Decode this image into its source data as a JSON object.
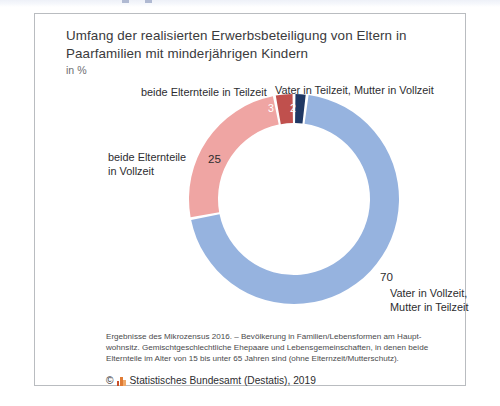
{
  "frame": {
    "border_color": "#b9bcc0",
    "background": "#ffffff"
  },
  "chart_data": {
    "type": "pie",
    "variant": "donut",
    "title": "Umfang der realisierten Erwerbsbeteiligung von Eltern in Paarfamilien mit minderjährigen Kindern",
    "subtitle": "in %",
    "unit": "%",
    "start_angle_deg": 0,
    "direction": "clockwise",
    "categories": [
      "Vater in Teilzeit, Mutter in Vollzeit",
      "Vater in Vollzeit, Mutter in Teilzeit",
      "beide Elternteile in Vollzeit",
      "beide Elternteile in Teilzeit"
    ],
    "values": [
      2,
      70,
      25,
      3
    ],
    "colors": [
      "#1f3864",
      "#96b3df",
      "#efa5a3",
      "#c0504d"
    ],
    "label_colors": [
      "#ffffff",
      "#2d2d2f",
      "#2d2d2f",
      "#ffffff"
    ],
    "legend": "none",
    "grid": false,
    "slices": [
      {
        "label": "Vater in Teilzeit, Mutter in Vollzeit",
        "value": 2,
        "value_text": "2",
        "color": "#1f3864"
      },
      {
        "label": "Vater in Vollzeit, Mutter in Teilzeit",
        "value": 70,
        "value_text": "70",
        "color": "#96b3df"
      },
      {
        "label": "beide Elternteile in Vollzeit",
        "value": 25,
        "value_text": "25",
        "color": "#efa5a3"
      },
      {
        "label": "beide Elternteile in Teilzeit",
        "value": 3,
        "value_text": "3",
        "color": "#c0504d"
      }
    ]
  },
  "callouts": {
    "teilzeit_both": "beide Elternteile in Teilzeit",
    "vater_teilzeit": "Vater in Teilzeit, Mutter in Vollzeit",
    "vollzeit_both_line1": "beide Elternteile",
    "vollzeit_both_line2": "in Vollzeit",
    "vater_vollzeit_line1": "Vater in Vollzeit,",
    "vater_vollzeit_line2": "Mutter in Teilzeit"
  },
  "footnote": {
    "line1": "Ergebnisse des Mikrozensus 2016. – Bevölkerung in Familien/Lebensformen am Haupt-",
    "line2": "wohnsitz. Gemischtgeschlechtliche Ehepaare und Lebensgemeinschaften, in denen beide",
    "line3": "Elternteile im Alter von 15 bis unter 65 Jahren sind (ohne Elternzeit/Mutterschutz)."
  },
  "copyright": {
    "symbol": "©",
    "logo_icon": "destatis-bars-icon",
    "text": "Statistisches Bundesamt (Destatis), 2019"
  }
}
